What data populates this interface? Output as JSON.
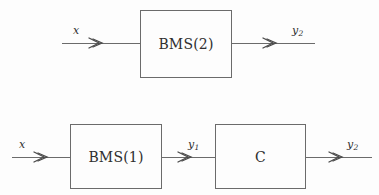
{
  "diagram": {
    "background_color": "#fdfdfd",
    "line_color": "#6b6b6b",
    "text_color": "#2f2f2f",
    "rows": [
      {
        "id": "top",
        "input_label": "x",
        "blocks": [
          {
            "id": "bms2",
            "label": "BMS(2)"
          }
        ],
        "output_label": "y",
        "output_subscript": "2"
      },
      {
        "id": "bottom",
        "input_label": "x",
        "blocks": [
          {
            "id": "bms1",
            "label": "BMS(1)"
          },
          {
            "id": "c",
            "label": "C"
          }
        ],
        "intermediate_label": "y",
        "intermediate_subscript": "1",
        "output_label": "y",
        "output_subscript": "2"
      }
    ]
  }
}
